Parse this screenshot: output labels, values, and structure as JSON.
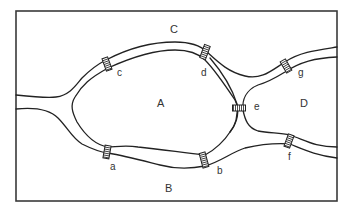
{
  "regions": [
    {
      "id": "A",
      "label": "A"
    },
    {
      "id": "B",
      "label": "B"
    },
    {
      "id": "C",
      "label": "C"
    },
    {
      "id": "D",
      "label": "D"
    }
  ],
  "bridges": [
    {
      "id": "a",
      "label": "a",
      "connects": [
        "A",
        "B"
      ]
    },
    {
      "id": "b",
      "label": "b",
      "connects": [
        "A",
        "B"
      ]
    },
    {
      "id": "c",
      "label": "c",
      "connects": [
        "A",
        "C"
      ]
    },
    {
      "id": "d",
      "label": "d",
      "connects": [
        "A",
        "C"
      ]
    },
    {
      "id": "e",
      "label": "e",
      "connects": [
        "A",
        "D"
      ]
    },
    {
      "id": "f",
      "label": "f",
      "connects": [
        "B",
        "D"
      ]
    },
    {
      "id": "g",
      "label": "g",
      "connects": [
        "C",
        "D"
      ]
    }
  ],
  "colors": {
    "line": "#222222",
    "frame": "#3a3a3a",
    "background": "#ffffff"
  }
}
